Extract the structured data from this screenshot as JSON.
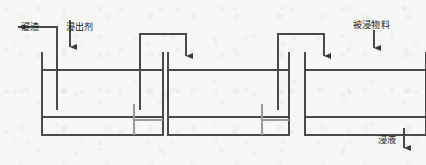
{
  "figure": {
    "type": "process-flow-diagram",
    "tank_count": 3,
    "line_color": "#4a4a4a",
    "text_color": "#1b1b1b",
    "background_color": "#f7f7f6"
  },
  "labels": {
    "leach_residue": "浸渣",
    "leaching_agent": "浸出剂",
    "material_to_be_leached": "被浸物料",
    "leachate": "浸液"
  },
  "flows": [
    {
      "name": "leach-residue-outlet",
      "label": "浸渣",
      "direction": "left",
      "arrow": "left-arrow",
      "position": "top-left"
    },
    {
      "name": "leaching-agent-inlet",
      "label": "浸出剂",
      "direction": "down",
      "arrow": "down-arrow",
      "position": "top, into tank 1"
    },
    {
      "name": "material-inlet",
      "label": "被浸物料",
      "direction": "down",
      "arrow": "down-arrow",
      "position": "top-right, into tank 3"
    },
    {
      "name": "leachate-outlet",
      "label": "浸液",
      "direction": "down",
      "arrow": "down-arrow",
      "position": "bottom-right, out of tank 3"
    },
    {
      "name": "tank2-to-tank1-overflow",
      "direction": "down-then-left",
      "arrow": "down-arrow",
      "position": "tank 2 overflow returns to tank 1 region"
    },
    {
      "name": "tank3-to-tank2-overflow",
      "direction": "down-then-left",
      "arrow": "down-arrow",
      "position": "tank 3 overflow returns to tank 2 region"
    }
  ],
  "tanks": [
    {
      "name": "tank-1",
      "x": 42,
      "y": 52,
      "width": 121,
      "height": 83,
      "liquid_line_y": 70,
      "sediment_line_y": 117
    },
    {
      "name": "tank-2",
      "x": 168,
      "y": 52,
      "width": 121,
      "height": 83,
      "liquid_line_y": 70,
      "sediment_line_y": 117
    },
    {
      "name": "tank-3",
      "x": 305,
      "y": 52,
      "width": 121,
      "height": 83,
      "liquid_line_y": 70,
      "sediment_line_y": 117
    }
  ]
}
